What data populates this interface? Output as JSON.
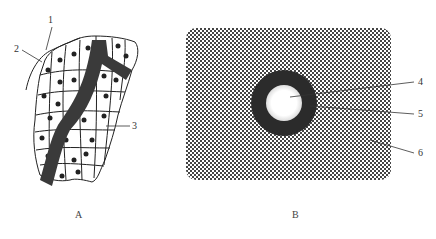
{
  "figure": {
    "panel_a": {
      "label": "A",
      "callouts": [
        "1",
        "2",
        "3"
      ]
    },
    "panel_b": {
      "label": "B",
      "callouts": [
        "4",
        "5",
        "6"
      ]
    },
    "caption": ""
  },
  "colors": {
    "ink": "#333333",
    "dark_band": "#3a3a3a",
    "hatch": "#555555",
    "background": "#ffffff"
  }
}
